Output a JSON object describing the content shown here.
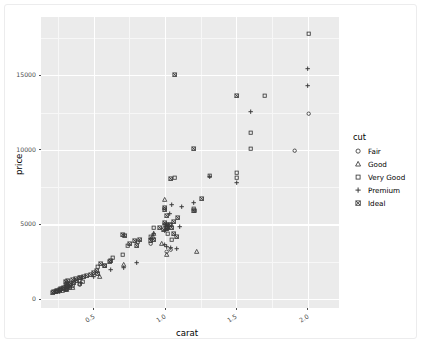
{
  "chart_data": {
    "type": "scatter",
    "title": "",
    "xlabel": "carat",
    "ylabel": "price",
    "xlim": [
      0.13,
      2.22
    ],
    "ylim": [
      -600,
      18900
    ],
    "xticks": [
      0.5,
      1.0,
      1.5,
      2.0
    ],
    "xticklabels": [
      "0.5",
      "1.0",
      "1.5",
      "2.0"
    ],
    "yticks": [
      0,
      5000,
      10000,
      15000
    ],
    "yticklabels": [
      "0",
      "5000",
      "10000",
      "15000"
    ],
    "grid": true,
    "legend": {
      "title": "cut",
      "position": "right",
      "entries": [
        {
          "name": "Fair",
          "marker": "circle"
        },
        {
          "name": "Good",
          "marker": "triangle"
        },
        {
          "name": "Very Good",
          "marker": "square"
        },
        {
          "name": "Premium",
          "marker": "plus"
        },
        {
          "name": "Ideal",
          "marker": "crossed-square"
        }
      ]
    },
    "series": [
      {
        "name": "Fair",
        "marker": "circle",
        "points": [
          [
            2.01,
            12445
          ],
          [
            1.91,
            9925
          ],
          [
            1.01,
            3205
          ],
          [
            0.9,
            3700
          ],
          [
            0.31,
            700
          ],
          [
            0.27,
            620
          ],
          [
            0.4,
            980
          ],
          [
            1.04,
            3320
          ]
        ]
      },
      {
        "name": "Good",
        "marker": "triangle",
        "points": [
          [
            1.0,
            6650
          ],
          [
            1.22,
            3180
          ],
          [
            0.98,
            3680
          ],
          [
            0.92,
            4350
          ],
          [
            1.01,
            2980
          ],
          [
            0.31,
            640
          ],
          [
            0.35,
            760
          ],
          [
            0.71,
            2270
          ],
          [
            0.54,
            1480
          ],
          [
            0.26,
            560
          ],
          [
            0.3,
            600
          ],
          [
            0.91,
            4150
          ]
        ]
      },
      {
        "name": "Very Good",
        "marker": "square",
        "points": [
          [
            2.01,
            17800
          ],
          [
            1.7,
            13650
          ],
          [
            1.6,
            11150
          ],
          [
            1.6,
            10050
          ],
          [
            1.5,
            8500
          ],
          [
            1.5,
            8100
          ],
          [
            1.31,
            8250
          ],
          [
            1.2,
            6050
          ],
          [
            1.21,
            5900
          ],
          [
            1.07,
            8100
          ],
          [
            1.01,
            4800
          ],
          [
            1.02,
            4400
          ],
          [
            1.0,
            5000
          ],
          [
            0.92,
            4750
          ],
          [
            0.9,
            4200
          ],
          [
            0.81,
            3850
          ],
          [
            0.74,
            3600
          ],
          [
            0.7,
            2950
          ],
          [
            0.63,
            2800
          ],
          [
            0.58,
            2250
          ],
          [
            0.53,
            2200
          ],
          [
            0.42,
            1180
          ],
          [
            0.35,
            900
          ],
          [
            0.31,
            700
          ],
          [
            0.28,
            590
          ],
          [
            0.24,
            480
          ],
          [
            1.04,
            4950
          ],
          [
            1.05,
            4000
          ],
          [
            0.33,
            780
          ],
          [
            0.4,
            1000
          ]
        ]
      },
      {
        "name": "Premium",
        "marker": "plus",
        "points": [
          [
            2.0,
            15450
          ],
          [
            2.0,
            14300
          ],
          [
            1.6,
            12550
          ],
          [
            1.5,
            7800
          ],
          [
            1.31,
            8200
          ],
          [
            1.2,
            6450
          ],
          [
            1.12,
            6200
          ],
          [
            1.05,
            6350
          ],
          [
            1.03,
            5750
          ],
          [
            1.01,
            5000
          ],
          [
            1.01,
            4900
          ],
          [
            1.0,
            4550
          ],
          [
            1.01,
            3500
          ],
          [
            1.0,
            3650
          ],
          [
            1.04,
            3450
          ],
          [
            1.08,
            3350
          ],
          [
            0.92,
            4400
          ],
          [
            0.9,
            4050
          ],
          [
            0.8,
            2450
          ],
          [
            0.71,
            2100
          ],
          [
            0.62,
            1950
          ],
          [
            0.5,
            1500
          ],
          [
            0.41,
            1100
          ],
          [
            0.33,
            780
          ],
          [
            0.3,
            640
          ],
          [
            0.26,
            520
          ],
          [
            1.02,
            4700
          ],
          [
            1.1,
            4850
          ]
        ]
      },
      {
        "name": "Ideal",
        "marker": "crossed-square",
        "points": [
          [
            1.07,
            15050
          ],
          [
            1.5,
            13600
          ],
          [
            1.2,
            10050
          ],
          [
            1.26,
            6700
          ],
          [
            1.04,
            8050
          ],
          [
            1.2,
            5950
          ],
          [
            1.06,
            5150
          ],
          [
            1.03,
            4950
          ],
          [
            1.01,
            5000
          ],
          [
            1.0,
            5100
          ],
          [
            1.0,
            6100
          ],
          [
            1.0,
            6000
          ],
          [
            1.01,
            4700
          ],
          [
            1.02,
            4750
          ],
          [
            1.05,
            4800
          ],
          [
            1.06,
            4400
          ],
          [
            1.08,
            4150
          ],
          [
            0.99,
            4650
          ],
          [
            0.96,
            4800
          ],
          [
            0.92,
            4000
          ],
          [
            0.9,
            3900
          ],
          [
            0.82,
            3950
          ],
          [
            0.8,
            3550
          ],
          [
            0.79,
            3900
          ],
          [
            0.72,
            4250
          ],
          [
            0.7,
            4300
          ],
          [
            0.62,
            2600
          ],
          [
            0.58,
            2250
          ],
          [
            0.55,
            2400
          ],
          [
            0.53,
            1700
          ],
          [
            0.5,
            1750
          ],
          [
            0.48,
            1600
          ],
          [
            0.45,
            1550
          ],
          [
            0.43,
            1500
          ],
          [
            0.4,
            1400
          ],
          [
            0.38,
            1200
          ],
          [
            0.36,
            1100
          ],
          [
            0.34,
            1000
          ],
          [
            0.33,
            950
          ],
          [
            0.32,
            880
          ],
          [
            0.31,
            840
          ],
          [
            0.3,
            800
          ],
          [
            0.29,
            760
          ],
          [
            0.28,
            700
          ],
          [
            0.27,
            660
          ],
          [
            0.26,
            620
          ],
          [
            0.25,
            580
          ],
          [
            0.24,
            540
          ],
          [
            0.23,
            500
          ],
          [
            0.22,
            470
          ],
          [
            0.21,
            440
          ],
          [
            0.35,
            1280
          ],
          [
            0.37,
            1350
          ],
          [
            0.52,
            1900
          ],
          [
            0.31,
            1050
          ],
          [
            0.3,
            1150
          ],
          [
            0.32,
            1250
          ],
          [
            0.41,
            1450
          ],
          [
            0.61,
            2500
          ],
          [
            0.75,
            3700
          ],
          [
            1.09,
            5450
          ],
          [
            1.01,
            5600
          ]
        ]
      }
    ]
  }
}
